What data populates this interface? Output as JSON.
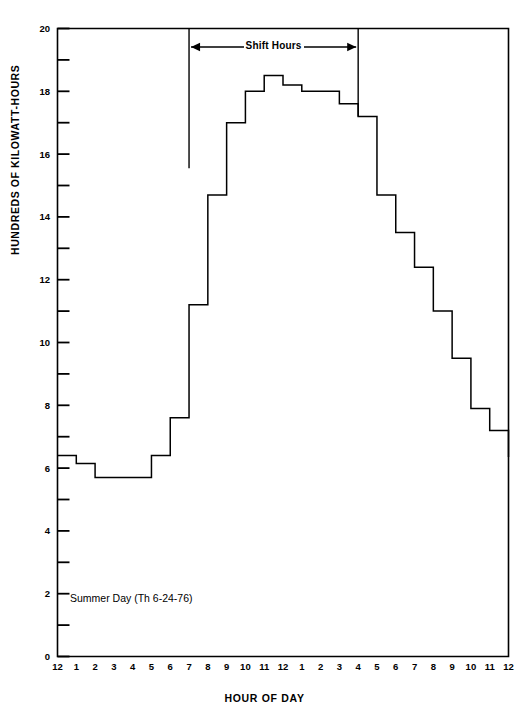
{
  "chart_data": {
    "type": "line",
    "title": "",
    "xlabel": "HOUR OF DAY",
    "ylabel": "HUNDREDS OF KILOWATT-HOURS",
    "xlim": [
      0,
      24
    ],
    "ylim": [
      0,
      20
    ],
    "grid": false,
    "legend": null,
    "step_style": "post",
    "annotation": "Summer Day (Th 6-24-76)",
    "shift_label": "Shift Hours",
    "shift_start_hour": 7,
    "shift_end_hour": 16,
    "x_tick_labels": [
      "12",
      "1",
      "2",
      "3",
      "4",
      "5",
      "6",
      "7",
      "8",
      "9",
      "10",
      "11",
      "12",
      "1",
      "2",
      "3",
      "4",
      "5",
      "6",
      "7",
      "8",
      "9",
      "10",
      "11",
      "12"
    ],
    "y_tick_labels": [
      "0",
      "2",
      "4",
      "6",
      "8",
      "10",
      "12",
      "14",
      "16",
      "18",
      "20"
    ],
    "y_major_ticks": [
      0,
      2,
      4,
      6,
      8,
      10,
      12,
      14,
      16,
      18,
      20
    ],
    "y_minor_ticks": [
      1,
      3,
      5,
      7,
      9,
      11,
      13,
      15,
      17,
      19
    ],
    "x": [
      0,
      1,
      2,
      3,
      4,
      5,
      6,
      7,
      8,
      9,
      10,
      11,
      12,
      13,
      14,
      15,
      16,
      17,
      18,
      19,
      20,
      21,
      22,
      23,
      24
    ],
    "values": [
      6.4,
      6.15,
      5.7,
      5.7,
      5.7,
      6.4,
      7.6,
      11.2,
      14.7,
      17.0,
      18.0,
      18.5,
      18.2,
      18.0,
      18.0,
      17.6,
      17.2,
      14.7,
      13.5,
      12.4,
      11.0,
      9.5,
      7.9,
      7.2,
      6.35
    ],
    "series": [
      {
        "name": "Summer Day (Th 6-24-76)",
        "values": [
          6.4,
          6.15,
          5.7,
          5.7,
          5.7,
          6.4,
          7.6,
          11.2,
          14.7,
          17.0,
          18.0,
          18.5,
          18.2,
          18.0,
          18.0,
          17.6,
          17.2,
          14.7,
          13.5,
          12.4,
          11.0,
          9.5,
          7.9,
          7.2,
          6.35
        ]
      }
    ]
  }
}
